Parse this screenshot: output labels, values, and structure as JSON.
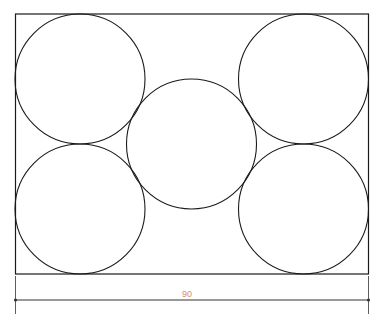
{
  "diagram": {
    "title": "",
    "stroke_color": "#1a1a1a",
    "dimension_color": "#333333",
    "dimension_text_color": "#d98a6a",
    "frame": {
      "x": 15.5,
      "y": 14,
      "width": 353,
      "height": 260
    },
    "circles": [
      {
        "name": "circle-top-left",
        "cx": 80,
        "cy": 79,
        "r": 65
      },
      {
        "name": "circle-top-right",
        "cx": 303.5,
        "cy": 79,
        "r": 65
      },
      {
        "name": "circle-center",
        "cx": 191.5,
        "cy": 144,
        "r": 65
      },
      {
        "name": "circle-bottom-left",
        "cx": 80,
        "cy": 209,
        "r": 65
      },
      {
        "name": "circle-bottom-right",
        "cx": 303.5,
        "cy": 209,
        "r": 65
      }
    ],
    "dimension": {
      "label": "90",
      "x1": 15.5,
      "x2": 368.5,
      "y": 300,
      "ext_top": 276,
      "ext_bottom": 314,
      "label_x": 187,
      "label_y": 297
    }
  }
}
